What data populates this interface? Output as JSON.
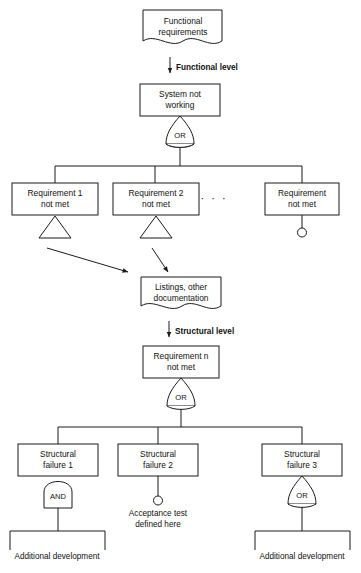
{
  "diagram": {
    "line_color": "#1a1a1a",
    "fill_color": "#ffffff",
    "nodes": {
      "functional_requirements": {
        "line1": "Functional",
        "line2": "requirements",
        "shape": "document"
      },
      "system_not_working": {
        "line1": "System not",
        "line2": "working",
        "shape": "rectangle"
      },
      "requirement_1": {
        "line1": "Requirement 1",
        "line2": "not met",
        "shape": "rectangle"
      },
      "requirement_2": {
        "line1": "Requirement 2",
        "line2": "not met",
        "shape": "rectangle"
      },
      "requirement_n_top": {
        "line1": "Requirement",
        "line2": "not met",
        "shape": "rectangle"
      },
      "listings_documentation": {
        "line1": "Listings, other",
        "line2": "documentation",
        "shape": "document"
      },
      "requirement_n": {
        "line1": "Requirement n",
        "line2": "not met",
        "shape": "rectangle"
      },
      "structural_failure_1": {
        "line1": "Structural",
        "line2": "failure 1",
        "shape": "rectangle"
      },
      "structural_failure_2": {
        "line1": "Structural",
        "line2": "failure 2",
        "shape": "rectangle"
      },
      "structural_failure_3": {
        "line1": "Structural",
        "line2": "failure 3",
        "shape": "rectangle"
      }
    },
    "gates": {
      "or_top": "OR",
      "or_middle": "OR",
      "and_failure_1": "AND",
      "or_failure_3": "OR"
    },
    "level_labels": {
      "functional": "Functional level",
      "structural": "Structural level"
    },
    "annotations": {
      "ellipsis": "· · ·",
      "acceptance_test_line1": "Acceptance test",
      "acceptance_test_line2": "defined here",
      "additional_development_left": "Additional development",
      "additional_development_right": "Additional development"
    }
  }
}
